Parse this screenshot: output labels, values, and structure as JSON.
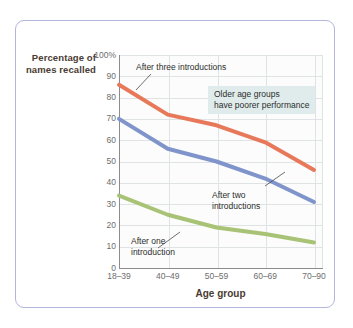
{
  "chart_data": {
    "type": "line",
    "title": "",
    "xlabel": "Age group",
    "ylabel": "Percentage of names recalled",
    "categories": [
      "18–39",
      "40–49",
      "50–59",
      "60–69",
      "70–90"
    ],
    "ylim": [
      0,
      100
    ],
    "yticks": [
      "0",
      "10",
      "20",
      "30",
      "40",
      "50",
      "60",
      "70",
      "80",
      "90",
      "100%"
    ],
    "ytick_values": [
      0,
      10,
      20,
      30,
      40,
      50,
      60,
      70,
      80,
      90,
      100
    ],
    "grid": true,
    "legend": "inline-annotations",
    "series": [
      {
        "name": "After three introductions",
        "color": "#e8785a",
        "values": [
          86,
          72,
          67,
          59,
          46
        ]
      },
      {
        "name": "After two introductions",
        "color": "#8094cc",
        "values": [
          70,
          56,
          50,
          42,
          31
        ]
      },
      {
        "name": "After one introduction",
        "color": "#a8c276",
        "values": [
          34,
          25,
          19,
          16,
          12
        ]
      }
    ],
    "annotations": [
      {
        "id": "three",
        "text": "After three introductions"
      },
      {
        "id": "two",
        "text": "After two\nintroductions"
      },
      {
        "id": "one",
        "text": "After one\nintroduction"
      },
      {
        "id": "callout",
        "text": "Older age groups\nhave poorer performance",
        "background": "#dfeceb"
      }
    ]
  },
  "figure": {
    "border_color": "#b3b6dc",
    "plot_background": "#fbfcfb",
    "grid_color": "#dfe3e4",
    "axis_color": "#8c8c8c",
    "label_color": "#4a3b32",
    "tick_color": "#6d6d6d"
  }
}
